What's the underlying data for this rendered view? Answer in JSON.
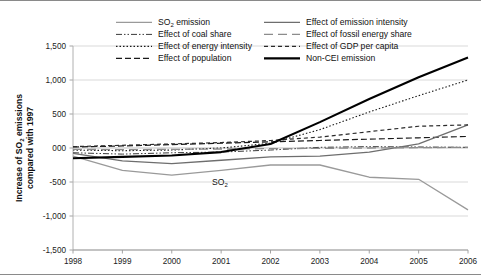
{
  "figure": {
    "background_color": "#ffffff",
    "frame_color": "#8a8a8a"
  },
  "annotations": [
    {
      "id": "so2-inline",
      "text": "SO",
      "sub": "2",
      "x": 212,
      "y": 184
    }
  ],
  "chart_data": {
    "type": "line",
    "title": "",
    "xlabel": "",
    "ylabel": "Increase of SO",
    "ylabel_sub": "2",
    "ylabel_tail": " emissions compared with 1997",
    "x": [
      1998,
      1999,
      2000,
      2001,
      2002,
      2003,
      2004,
      2005,
      2006
    ],
    "categories": [
      "1998",
      "1999",
      "2000",
      "2001",
      "2002",
      "2003",
      "2004",
      "2005",
      "2006"
    ],
    "yticks": [
      1500,
      1000,
      500,
      0,
      -500,
      -1000,
      -1500
    ],
    "ytick_labels": [
      "1,500",
      "1,000",
      "500",
      "000",
      "-500",
      "-1,000",
      "-1,500"
    ],
    "ylim": [
      -1500,
      1500
    ],
    "xlim": [
      1998,
      2006
    ],
    "grid": true,
    "grid_axis": "y",
    "legend_position": "top-inside",
    "series": [
      {
        "name": "SO2 emission",
        "label": "SO",
        "label_sub": "2",
        "label_tail": " emission",
        "color": "#9a9a9a",
        "width": 1.3,
        "dash": "none",
        "legend_col": 0,
        "legend_row": 0,
        "values": [
          -120,
          -330,
          -400,
          -330,
          -250,
          -250,
          -430,
          -460,
          -910
        ]
      },
      {
        "name": "Effect of coal share",
        "label": "Effect of coal share",
        "color": "#3a3a3a",
        "width": 1.0,
        "dash": "6,2,1.5,2,1.5,2",
        "legend_col": 0,
        "legend_row": 1,
        "values": [
          -70,
          -90,
          -70,
          -60,
          -30,
          10,
          20,
          15,
          10
        ]
      },
      {
        "name": "Effect of energy intensity",
        "label": "Effect of energy intensity",
        "color": "#1a1a1a",
        "width": 1.1,
        "dash": "1.5,2",
        "legend_col": 0,
        "legend_row": 2,
        "values": [
          -30,
          -40,
          -30,
          0,
          70,
          270,
          530,
          770,
          1000
        ]
      },
      {
        "name": "Effect of population",
        "label": "Effect of population",
        "color": "#1a1a1a",
        "width": 1.2,
        "dash": "6,3",
        "legend_col": 0,
        "legend_row": 3,
        "values": [
          15,
          30,
          50,
          70,
          90,
          110,
          130,
          150,
          170
        ]
      },
      {
        "name": "Effect of emission intensity",
        "label": "Effect of emission intensity",
        "color": "#6e6e6e",
        "width": 1.3,
        "dash": "none",
        "legend_col": 1,
        "legend_row": 0,
        "values": [
          -80,
          -190,
          -230,
          -180,
          -130,
          -120,
          -60,
          60,
          340
        ]
      },
      {
        "name": "Effect of fossil energy share",
        "label": "Effect of fossil energy share",
        "color": "#8c8c8c",
        "width": 1.3,
        "dash": "9,5",
        "legend_col": 1,
        "legend_row": 1,
        "values": [
          -20,
          -25,
          -20,
          -15,
          -10,
          -5,
          0,
          5,
          10
        ]
      },
      {
        "name": "Effect of GDP per capita",
        "label": "Effect of GDP per capita",
        "color": "#2a2a2a",
        "width": 1.2,
        "dash": "4,3",
        "legend_col": 1,
        "legend_row": 2,
        "values": [
          20,
          40,
          60,
          80,
          110,
          160,
          240,
          320,
          340
        ]
      },
      {
        "name": "Non-CEI emission",
        "label": "Non-CEI emission",
        "color": "#000000",
        "width": 2.1,
        "dash": "none",
        "legend_col": 1,
        "legend_row": 3,
        "values": [
          -150,
          -130,
          -110,
          -60,
          60,
          380,
          720,
          1040,
          1330
        ]
      }
    ]
  }
}
